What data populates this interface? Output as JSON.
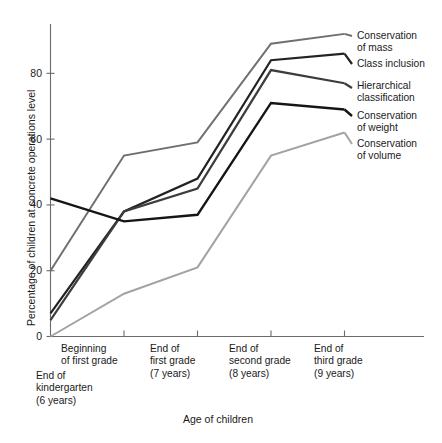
{
  "chart_data": {
    "type": "line",
    "title": "",
    "xlabel": "Age of children",
    "ylabel": "Percentage of children at concrete operations level",
    "categories": [
      "End of kindergarten (6 years)",
      "Beginning of first grade",
      "End of first grade (7 years)",
      "End of second grade (8 years)",
      "End of third grade (9 years)"
    ],
    "x": [
      0,
      1,
      2,
      3,
      4
    ],
    "ylim": [
      0,
      95
    ],
    "yticks": [
      0,
      20,
      40,
      60,
      80
    ],
    "ytick_labels": [
      "0",
      "20",
      "40",
      "60",
      "80"
    ],
    "grid": false,
    "legend_position": "right",
    "series": [
      {
        "name": "Conservation of mass",
        "color": "#6f6f6f",
        "width": 2.0,
        "values": [
          20,
          55,
          59,
          89,
          92
        ]
      },
      {
        "name": "Class inclusion",
        "color": "#232323",
        "width": 2.2,
        "values": [
          7,
          38,
          48,
          84,
          86
        ]
      },
      {
        "name": "Hierarchical classification",
        "color": "#3d3d3d",
        "width": 2.2,
        "values": [
          5,
          38,
          45,
          81,
          77
        ]
      },
      {
        "name": "Conservation of weight",
        "color": "#151515",
        "width": 2.4,
        "values": [
          42,
          35,
          37,
          71,
          69
        ]
      },
      {
        "name": "Conservation of volume",
        "color": "#a3a3a3",
        "width": 2.0,
        "values": [
          0,
          13,
          21,
          55,
          62
        ]
      }
    ]
  },
  "axes": {
    "y_title": "Percentage of children at concrete operations level",
    "x_title": "Age of children",
    "y_tick_0": "0",
    "y_tick_20": "20",
    "y_tick_40": "40",
    "y_tick_60": "60",
    "y_tick_80": "80"
  },
  "x_ticks": [
    {
      "line1": "End of",
      "line2": "kindergarten",
      "line3": "(6 years)"
    },
    {
      "line1": "Beginning",
      "line2": "of first grade",
      "line3": ""
    },
    {
      "line1": "End of",
      "line2": "first grade",
      "line3": "(7 years)"
    },
    {
      "line1": "End of",
      "line2": "second grade",
      "line3": "(8 years)"
    },
    {
      "line1": "End of",
      "line2": "third grade",
      "line3": "(9 years)"
    }
  ],
  "legend": [
    {
      "line1": "Conservation",
      "line2": "of mass"
    },
    {
      "line1": "Class inclusion",
      "line2": ""
    },
    {
      "line1": "Hierarchical",
      "line2": "classification"
    },
    {
      "line1": "Conservation",
      "line2": "of weight"
    },
    {
      "line1": "Conservation",
      "line2": "of volume"
    }
  ]
}
